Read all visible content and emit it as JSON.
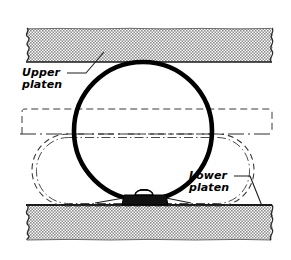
{
  "diagram": {
    "type": "engineering-cross-section",
    "background_color": "#ffffff",
    "ink_color": "#000000",
    "hatch_fill_color": "#9a9a9a",
    "labels": {
      "upper_platen": "Upper\nplaten",
      "lower_platen": "Lower\nplaten"
    },
    "parts": {
      "upper_platen": {
        "name": "Upper platen",
        "x": 25,
        "y": 28,
        "width": 248,
        "height": 34,
        "fill": "halftone-stipple",
        "break_edges": [
          "left",
          "right"
        ]
      },
      "lower_platen": {
        "name": "Lower platen",
        "x": 25,
        "y": 205,
        "width": 248,
        "height": 35,
        "fill": "halftone-stipple",
        "break_edges": [
          "left",
          "right"
        ]
      },
      "specimen_circle": {
        "name": "Circular specimen outline",
        "cx": 143,
        "cy": 131,
        "r": 69,
        "stroke_width": 4.5,
        "stroke": "#000000",
        "fill": "none"
      },
      "phantom_outline": {
        "name": "Deformed phantom outline",
        "x": 32,
        "y": 134,
        "width": 222,
        "height": 72,
        "corner_radius": 36,
        "line_style": "dashed"
      },
      "phantom_outline_inner": {
        "name": "Deformed phantom outline inner",
        "x": 36,
        "y": 137,
        "width": 214,
        "height": 67,
        "corner_radius": 33,
        "line_style": "dash-dot"
      },
      "centerline": {
        "name": "Horizontal centerline",
        "y": 134,
        "x1": 22,
        "x2": 272,
        "line_style": "dash-dot"
      },
      "upper_phantom_box": {
        "name": "Upper phantom boundary",
        "x": 22,
        "y": 108,
        "width": 250,
        "height": 26,
        "line_style": "dashed"
      },
      "sample_block": {
        "name": "Sample block on lower platen",
        "x": 124,
        "y": 195,
        "width": 42,
        "height": 13,
        "fill": "#111111",
        "cap": "rounded-bump"
      }
    },
    "leaders": {
      "upper_platen_leader": {
        "name": "Upper platen leader line",
        "from_x": 70,
        "from_y": 73,
        "to_x": 92,
        "to_y": 57
      },
      "lower_platen_leader": {
        "name": "Lower platen leader line",
        "from_x": 236,
        "from_y": 176,
        "to_x": 258,
        "to_y": 207
      }
    }
  }
}
